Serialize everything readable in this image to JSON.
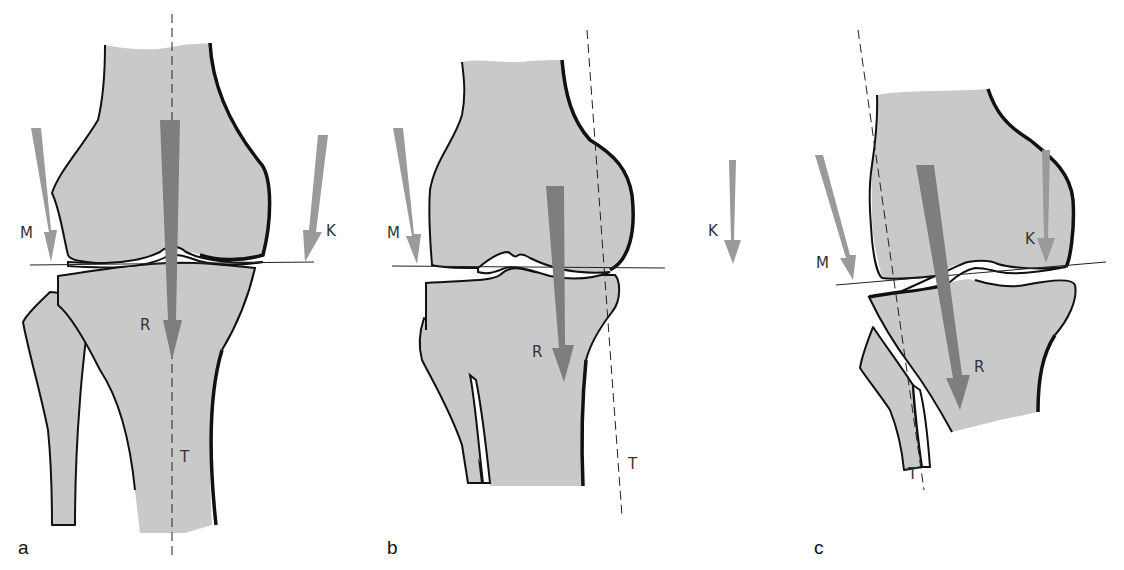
{
  "figure": {
    "colors": {
      "bone_fill": "#c9c9c9",
      "outline": "#111111",
      "force_arrow_light": "#9a9a9a",
      "force_arrow_dark": "#7e7e7e",
      "background": "#ffffff"
    },
    "panels": [
      {
        "id": "a",
        "label": "a",
        "arrows": {
          "M": "M",
          "K": "K",
          "R": "R"
        },
        "axis_label": "T"
      },
      {
        "id": "b",
        "label": "b",
        "arrows": {
          "M": "M",
          "K": "K",
          "R": "R"
        },
        "axis_label": "T"
      },
      {
        "id": "c",
        "label": "c",
        "arrows": {
          "M": "M",
          "K": "K",
          "R": "R"
        },
        "axis_label": "T"
      }
    ]
  }
}
